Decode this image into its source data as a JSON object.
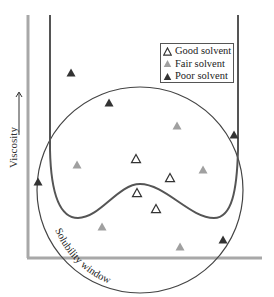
{
  "chart_data": {
    "type": "scatter",
    "title": "",
    "xlabel": "",
    "ylabel": "Viscosity",
    "ylabel_arrow": "→",
    "grid": false,
    "legend_position": "upper right",
    "annotations": [
      {
        "text": "Solubility window",
        "shape": "circle",
        "center": [
          140,
          190
        ],
        "radius": 103
      }
    ],
    "curve": {
      "name": "viscosity curve",
      "description": "U-shaped curve with two minima and central hump",
      "color": "#555555"
    },
    "series": [
      {
        "name": "Good solvent",
        "marker": "open-triangle",
        "color": "#333333",
        "points": [
          [
            136,
            159
          ],
          [
            170,
            178
          ],
          [
            137,
            193
          ],
          [
            156,
            209
          ]
        ]
      },
      {
        "name": "Fair solvent",
        "marker": "filled-triangle",
        "color": "#a0a0a0",
        "points": [
          [
            177,
            126
          ],
          [
            77,
            165
          ],
          [
            203,
            170
          ],
          [
            102,
            227
          ],
          [
            180,
            247
          ]
        ]
      },
      {
        "name": "Poor solvent",
        "marker": "filled-triangle",
        "color": "#333333",
        "points": [
          [
            71,
            73
          ],
          [
            109,
            103
          ],
          [
            38,
            182
          ],
          [
            234,
            135
          ],
          [
            223,
            240
          ]
        ]
      }
    ]
  },
  "legend": {
    "items": [
      {
        "label": "Good solvent",
        "icon": "open-triangle-icon"
      },
      {
        "label": "Fair solvent",
        "icon": "gray-triangle-icon"
      },
      {
        "label": "Poor solvent",
        "icon": "dark-triangle-icon"
      }
    ]
  },
  "axis": {
    "ylabel": "Viscosity"
  },
  "window_label": "Solubility window",
  "colors": {
    "axis": "#a8a8a8",
    "curve": "#555555",
    "circle": "#444444",
    "good": "#333333",
    "fair": "#a0a0a0",
    "poor": "#333333"
  }
}
